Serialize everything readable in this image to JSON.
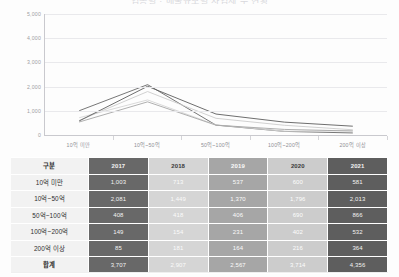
{
  "title": "업종별 · 매출규모별 사업체 수 현황",
  "chart_data": {
    "type": "line",
    "title": "업종별 · 매출규모별 사업체 수 현황",
    "xlabel": "",
    "ylabel": "",
    "ylim": [
      0,
      5000
    ],
    "yticks": [
      "0",
      "1,000",
      "2,000",
      "3,000",
      "4,000",
      "5,000"
    ],
    "ytick_values": [
      0,
      1000,
      2000,
      3000,
      4000,
      5000
    ],
    "grid": true,
    "legend": "none",
    "categories": [
      "10억 미만",
      "10억~50억",
      "50억~100억",
      "100억~200억",
      "200억 이상"
    ],
    "series": [
      {
        "name": "2017",
        "color": "#686868",
        "values": [
          1003,
          2081,
          408,
          149,
          85
        ]
      },
      {
        "name": "2018",
        "color": "#d5d5d5",
        "values": [
          713,
          1449,
          418,
          154,
          181
        ]
      },
      {
        "name": "2019",
        "color": "#a6a6a6",
        "values": [
          537,
          1370,
          406,
          231,
          164
        ]
      },
      {
        "name": "2020",
        "color": "#cccccc",
        "values": [
          600,
          1796,
          690,
          402,
          216
        ]
      },
      {
        "name": "2021",
        "color": "#5e5e5e",
        "values": [
          581,
          2013,
          866,
          532,
          364
        ]
      }
    ]
  },
  "table": {
    "corner_label": "구분",
    "columns": [
      "2017",
      "2018",
      "2019",
      "2020",
      "2021"
    ],
    "rows": [
      {
        "label": "10억 미만",
        "values": [
          "1,003",
          "713",
          "537",
          "600",
          "581"
        ]
      },
      {
        "label": "10억~50억",
        "values": [
          "2,081",
          "1,449",
          "1,370",
          "1,796",
          "2,013"
        ]
      },
      {
        "label": "50억~100억",
        "values": [
          "408",
          "418",
          "406",
          "690",
          "866"
        ]
      },
      {
        "label": "100억~200억",
        "values": [
          "149",
          "154",
          "231",
          "402",
          "532"
        ]
      },
      {
        "label": "200억 이상",
        "values": [
          "85",
          "181",
          "164",
          "216",
          "364"
        ]
      },
      {
        "label": "합계",
        "values": [
          "3,707",
          "2,907",
          "2,567",
          "3,714",
          "4,356"
        ]
      }
    ]
  }
}
